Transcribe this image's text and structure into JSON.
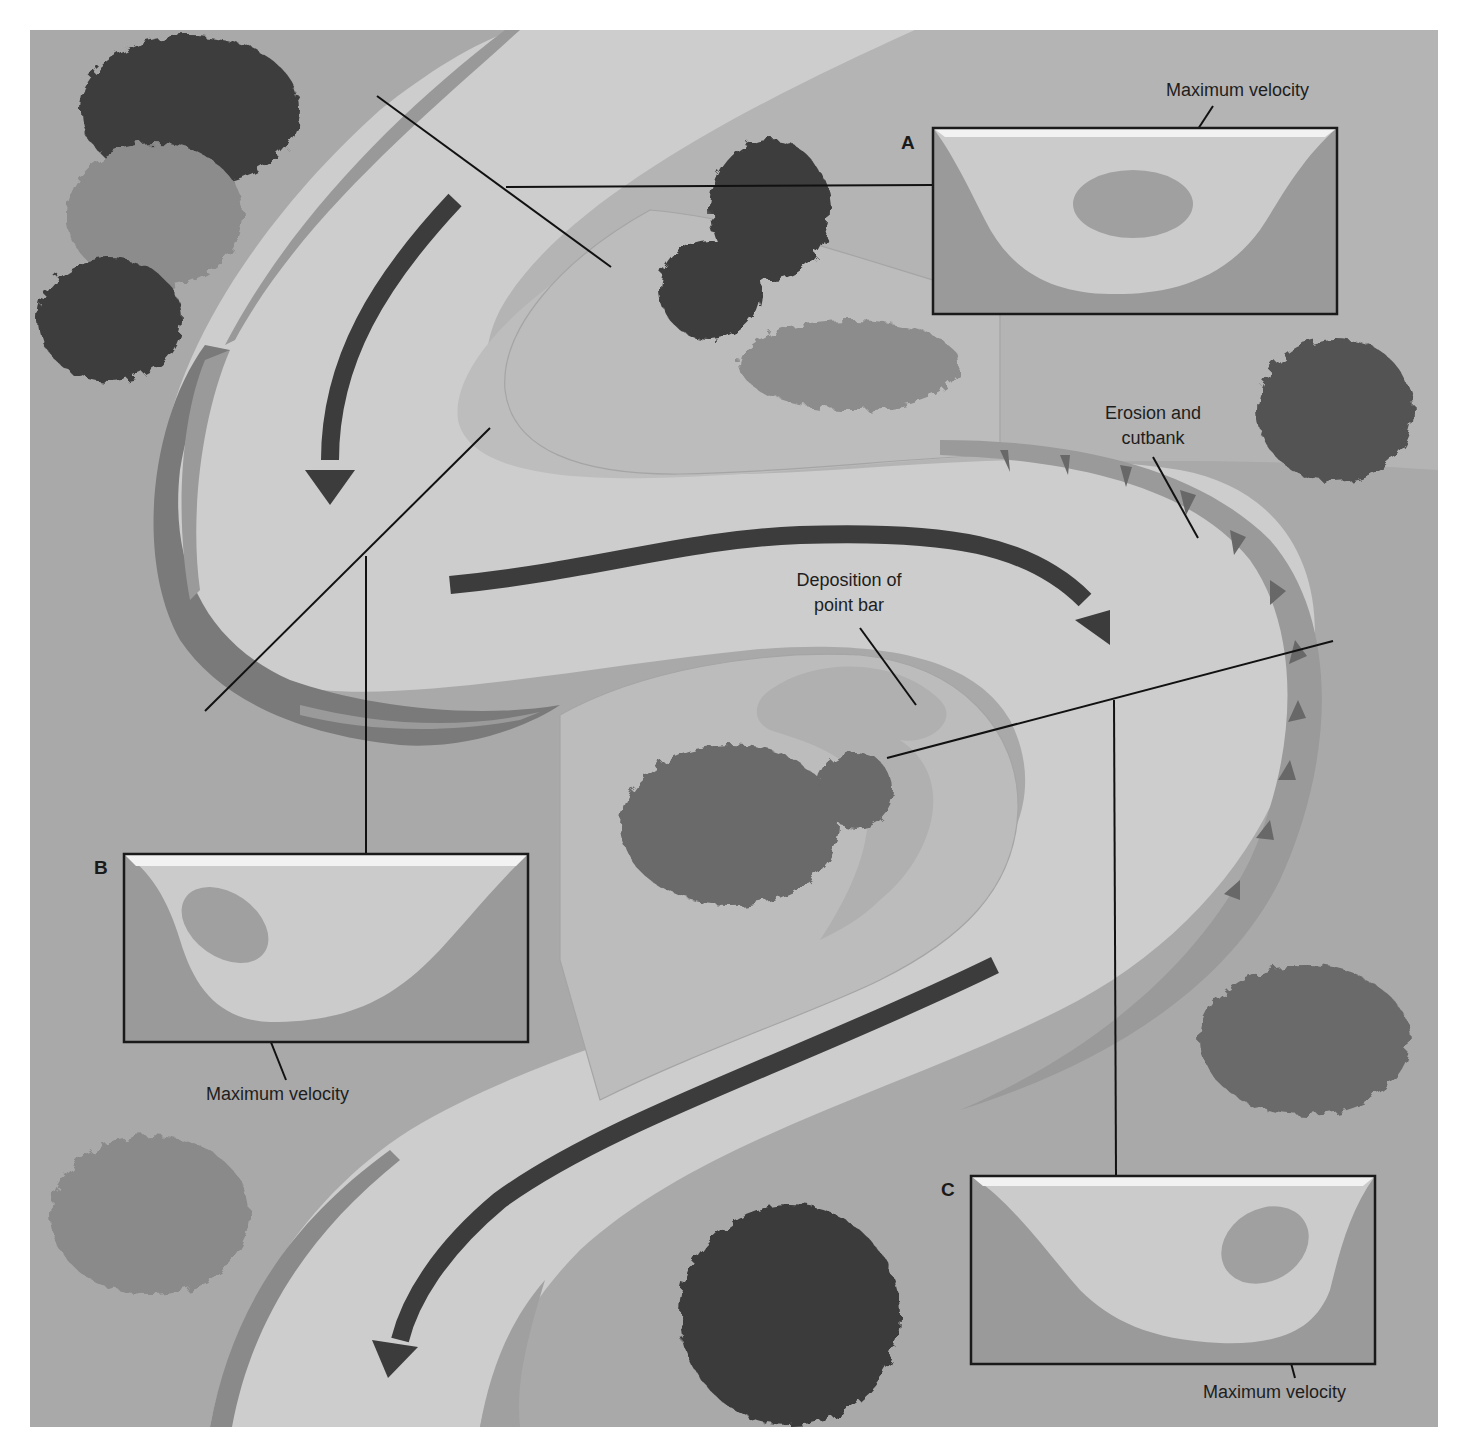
{
  "colors": {
    "page_bg": "#ffffff",
    "land": "#a9a9a9",
    "river_water": "#cdcdcd",
    "point_bar": "#bdbdbd",
    "point_bar_inner": "#c4c4c4",
    "cutbank": "#8f8f8f",
    "cutbank_dark": "#6a6a6a",
    "flow_arrow": "#3c3c3c",
    "tree_dark": "#3e3e3e",
    "tree_mid": "#6a6a6a",
    "tree_light": "#8c8c8c",
    "section_bank": "#9a9a9a",
    "section_water": "#cbcbcb",
    "section_surface": "#f2f2f2",
    "max_velocity_zone": "#a0a0a0",
    "leader_line": "#111111"
  },
  "labels": {
    "max_velocity_a": "Maximum velocity",
    "max_velocity_b": "Maximum velocity",
    "max_velocity_c": "Maximum velocity",
    "erosion_line1": "Erosion and",
    "erosion_line2": "cutbank",
    "deposition_line1": "Deposition of",
    "deposition_line2": "point bar"
  },
  "cross_sections": [
    {
      "id": "A",
      "letter": "A",
      "note": "symmetric channel, max velocity centered"
    },
    {
      "id": "B",
      "letter": "B",
      "note": "asymmetric channel, deep on left, max velocity near left bank"
    },
    {
      "id": "C",
      "letter": "C",
      "note": "asymmetric channel, deep on right, max velocity near right bank"
    }
  ],
  "features": {
    "flow_arrows": 4,
    "trees": 9
  }
}
